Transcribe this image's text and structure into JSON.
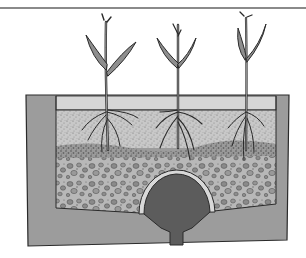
{
  "figure": {
    "title": "",
    "top_text_fragments": [
      "",
      ""
    ],
    "layers": [
      {
        "name": "water-surface-band",
        "color": "#d6d6d6"
      },
      {
        "name": "fine-sand",
        "color": "#c4c4c4"
      },
      {
        "name": "coarse-transition",
        "color": "#8c8c8c"
      },
      {
        "name": "gravel",
        "color": "#b4b4b4"
      },
      {
        "name": "drain-dome",
        "color": "#5c5c5c"
      },
      {
        "name": "container-wall",
        "color": "#9c9c9c"
      }
    ],
    "plants": [
      {
        "id": "plant-left",
        "stem_x": 106
      },
      {
        "id": "plant-middle",
        "stem_x": 178
      },
      {
        "id": "plant-right",
        "stem_x": 246
      }
    ],
    "colors": {
      "outline": "#2a2a2a",
      "leaf": "#8e8e8e",
      "wall": "#9c9c9c",
      "rule": "#8a8a8a"
    }
  }
}
